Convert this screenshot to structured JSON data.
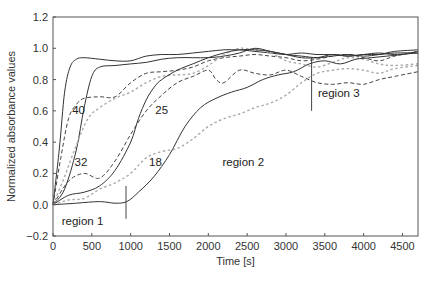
{
  "chart_data": {
    "type": "line",
    "title": "",
    "xlabel": "Time [s]",
    "ylabel": "Normalized absorbance values",
    "xlim": [
      0,
      4700
    ],
    "ylim": [
      -0.2,
      1.2
    ],
    "xticks": [
      0,
      500,
      1000,
      1500,
      2000,
      2500,
      3000,
      3500,
      4000,
      4500
    ],
    "yticks": [
      -0.2,
      0.0,
      0.2,
      0.4,
      0.6,
      0.8,
      1.0,
      1.2
    ],
    "ytick_labels": [
      "−0.2",
      "0.0",
      "0.2",
      "0.4",
      "0.6",
      "0.8",
      "1.0",
      "1.2"
    ],
    "grid": false,
    "legend": "none (curves labeled inline)",
    "series": [
      {
        "name": "40 (solid)",
        "style": "solid",
        "color": "#333333",
        "x": [
          0,
          80,
          150,
          220,
          300,
          400,
          600,
          800,
          1000,
          1200,
          1400,
          1600,
          1800,
          2000,
          2200,
          2400,
          2600,
          2800,
          3000,
          3200,
          3400,
          3600,
          3800,
          4000,
          4200,
          4400,
          4700
        ],
        "y": [
          0.0,
          0.35,
          0.72,
          0.88,
          0.93,
          0.94,
          0.93,
          0.92,
          0.92,
          0.95,
          0.96,
          0.96,
          0.97,
          0.98,
          0.99,
          0.99,
          0.98,
          0.97,
          0.96,
          0.97,
          0.96,
          0.96,
          0.95,
          0.96,
          0.96,
          0.97,
          0.97
        ]
      },
      {
        "name": "40 (dashed)",
        "style": "dashed",
        "color": "#444444",
        "x": [
          0,
          100,
          200,
          300,
          400,
          600,
          800,
          1000,
          1200,
          1400,
          1600,
          1800,
          2000,
          2200,
          2400,
          2600,
          2800,
          3000,
          3200,
          3400,
          3600,
          3800,
          4000,
          4200,
          4400,
          4700
        ],
        "y": [
          0.0,
          0.3,
          0.55,
          0.64,
          0.68,
          0.69,
          0.69,
          0.78,
          0.84,
          0.85,
          0.86,
          0.88,
          0.92,
          0.94,
          0.95,
          0.96,
          0.95,
          0.94,
          0.92,
          0.93,
          0.95,
          0.96,
          0.94,
          0.92,
          0.95,
          0.98
        ]
      },
      {
        "name": "32 (solid)",
        "style": "solid",
        "color": "#333333",
        "x": [
          0,
          150,
          300,
          400,
          500,
          600,
          800,
          1000,
          1200,
          1400,
          1600,
          1800,
          2000,
          2200,
          2400,
          2600,
          2800,
          3000,
          3200,
          3400,
          3600,
          3800,
          4000,
          4200,
          4400,
          4700
        ],
        "y": [
          0.0,
          0.1,
          0.35,
          0.62,
          0.82,
          0.88,
          0.89,
          0.9,
          0.91,
          0.93,
          0.94,
          0.94,
          0.94,
          0.95,
          0.97,
          1.0,
          0.98,
          0.96,
          0.95,
          0.94,
          0.95,
          0.96,
          0.95,
          0.96,
          0.98,
          0.99
        ]
      },
      {
        "name": "32 (gray dotted)",
        "style": "dotted",
        "color": "#aaaaaa",
        "x": [
          0,
          150,
          300,
          450,
          600,
          800,
          1000,
          1200,
          1400,
          1600,
          1800,
          2000,
          2200,
          2400,
          2600,
          2800,
          3000,
          3200,
          3400,
          3600,
          3800,
          4000,
          4200,
          4400,
          4700
        ],
        "y": [
          0.0,
          0.18,
          0.38,
          0.55,
          0.62,
          0.68,
          0.72,
          0.78,
          0.82,
          0.83,
          0.84,
          0.89,
          0.96,
          1.0,
          0.99,
          0.97,
          0.92,
          0.9,
          0.88,
          0.91,
          0.94,
          0.93,
          0.9,
          0.89,
          0.9
        ]
      },
      {
        "name": "25 (solid)",
        "style": "solid",
        "color": "#333333",
        "x": [
          0,
          200,
          400,
          600,
          800,
          1000,
          1100,
          1200,
          1300,
          1400,
          1600,
          1800,
          2000,
          2200,
          2400,
          2600,
          2800,
          3000,
          3200,
          3400,
          3600,
          3800,
          4000,
          4200,
          4400,
          4700
        ],
        "y": [
          0.0,
          0.06,
          0.08,
          0.12,
          0.22,
          0.4,
          0.55,
          0.67,
          0.75,
          0.8,
          0.86,
          0.9,
          0.94,
          0.97,
          0.99,
          0.99,
          0.98,
          0.96,
          0.94,
          0.94,
          0.96,
          0.95,
          0.96,
          0.97,
          0.96,
          0.97
        ]
      },
      {
        "name": "25 (dashed)",
        "style": "dashed",
        "color": "#444444",
        "x": [
          0,
          200,
          400,
          600,
          800,
          1000,
          1200,
          1400,
          1600,
          1800,
          2000,
          2100,
          2200,
          2400,
          2600,
          2800,
          3000,
          3200,
          3400,
          3600,
          3800,
          4000,
          4200,
          4400,
          4700
        ],
        "y": [
          0.0,
          0.15,
          0.2,
          0.17,
          0.28,
          0.45,
          0.6,
          0.7,
          0.78,
          0.82,
          0.86,
          0.8,
          0.78,
          0.86,
          0.84,
          0.83,
          0.86,
          0.82,
          0.78,
          0.77,
          0.78,
          0.77,
          0.8,
          0.82,
          0.85
        ]
      },
      {
        "name": "18 (solid)",
        "style": "solid",
        "color": "#333333",
        "x": [
          0,
          300,
          600,
          800,
          950,
          1100,
          1300,
          1500,
          1700,
          1900,
          2100,
          2300,
          2500,
          2700,
          2900,
          3100,
          3300,
          3500,
          3700,
          3900,
          4100,
          4300,
          4500,
          4700
        ],
        "y": [
          0.0,
          0.01,
          0.02,
          0.01,
          0.02,
          0.08,
          0.18,
          0.32,
          0.5,
          0.62,
          0.68,
          0.72,
          0.75,
          0.8,
          0.83,
          0.85,
          0.9,
          0.92,
          0.9,
          0.93,
          0.94,
          0.95,
          0.96,
          0.98
        ]
      },
      {
        "name": "18 (gray dotted)",
        "style": "dotted",
        "color": "#aaaaaa",
        "x": [
          0,
          200,
          400,
          600,
          800,
          1000,
          1200,
          1400,
          1600,
          1800,
          2000,
          2200,
          2400,
          2600,
          2800,
          3000,
          3200,
          3400,
          3600,
          3800,
          4000,
          4200,
          4400,
          4700
        ],
        "y": [
          0.0,
          0.03,
          0.04,
          0.1,
          0.14,
          0.2,
          0.3,
          0.34,
          0.36,
          0.42,
          0.5,
          0.55,
          0.58,
          0.62,
          0.65,
          0.7,
          0.78,
          0.84,
          0.86,
          0.87,
          0.86,
          0.84,
          0.87,
          0.89
        ]
      }
    ],
    "annotations": [
      {
        "text": "40",
        "x": 330,
        "y": 0.6
      },
      {
        "text": "32",
        "x": 360,
        "y": 0.27
      },
      {
        "text": "25",
        "x": 1400,
        "y": 0.6
      },
      {
        "text": "18",
        "x": 1320,
        "y": 0.27
      },
      {
        "text": "region 1",
        "x": 380,
        "y": -0.11
      },
      {
        "text": "region 2",
        "x": 2450,
        "y": 0.27
      },
      {
        "text": "region 3",
        "x": 3680,
        "y": 0.71
      }
    ],
    "markers": [
      {
        "x": 940,
        "y_from": -0.09,
        "y_to": 0.12
      },
      {
        "x": 3330,
        "y_from": 0.6,
        "y_to": 0.94
      }
    ]
  }
}
